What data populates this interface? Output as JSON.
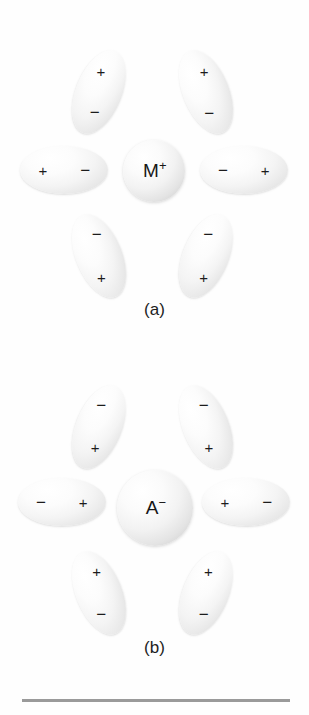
{
  "figure": {
    "background_color": "#fefefe",
    "rule_color": "#9a9a9a"
  },
  "panels": [
    {
      "id": "a",
      "caption": "(a)",
      "center_ion": {
        "symbol": "M",
        "charge": "+",
        "full_label": "M+",
        "diameter_px": 62,
        "kind": "cation"
      },
      "shell_note": "six solvent dipoles with negative poles oriented toward the cation",
      "dipoles": [
        {
          "position": "top-left",
          "rotation_deg": 22,
          "outer_pole": "+",
          "inner_pole": "−"
        },
        {
          "position": "top-right",
          "rotation_deg": -22,
          "outer_pole": "+",
          "inner_pole": "−"
        },
        {
          "position": "left",
          "rotation_deg": 0,
          "outer_pole": "+",
          "inner_pole": "−"
        },
        {
          "position": "right",
          "rotation_deg": 0,
          "outer_pole": "+",
          "inner_pole": "−"
        },
        {
          "position": "bottom-left",
          "rotation_deg": -22,
          "outer_pole": "+",
          "inner_pole": "−"
        },
        {
          "position": "bottom-right",
          "rotation_deg": 22,
          "outer_pole": "+",
          "inner_pole": "−"
        }
      ]
    },
    {
      "id": "b",
      "caption": "(b)",
      "center_ion": {
        "symbol": "A",
        "charge": "−",
        "full_label": "A-",
        "diameter_px": 76,
        "kind": "anion"
      },
      "shell_note": "six solvent dipoles with positive poles oriented toward the anion",
      "dipoles": [
        {
          "position": "top-left",
          "rotation_deg": 22,
          "outer_pole": "−",
          "inner_pole": "+"
        },
        {
          "position": "top-right",
          "rotation_deg": -22,
          "outer_pole": "−",
          "inner_pole": "+"
        },
        {
          "position": "left",
          "rotation_deg": 0,
          "outer_pole": "−",
          "inner_pole": "+"
        },
        {
          "position": "right",
          "rotation_deg": 0,
          "outer_pole": "−",
          "inner_pole": "+"
        },
        {
          "position": "bottom-left",
          "rotation_deg": -22,
          "outer_pole": "−",
          "inner_pole": "+"
        },
        {
          "position": "bottom-right",
          "rotation_deg": 22,
          "outer_pole": "−",
          "inner_pole": "+"
        }
      ]
    }
  ]
}
